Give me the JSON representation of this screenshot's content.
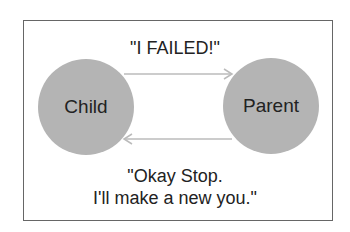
{
  "diagram": {
    "nodes": [
      {
        "id": "child",
        "label": "Child"
      },
      {
        "id": "parent",
        "label": "Parent"
      }
    ],
    "edges": [
      {
        "from": "child",
        "to": "parent",
        "label": "\"I FAILED!\""
      },
      {
        "from": "parent",
        "to": "child",
        "label_line1": "\"Okay Stop.",
        "label_line2": "I'll make a new you.\""
      }
    ],
    "colors": {
      "node_fill": "#b4b4b4",
      "arrow": "#bbbbbb",
      "border": "#666666"
    }
  }
}
